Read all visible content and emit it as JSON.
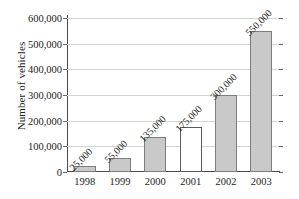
{
  "chart_data": {
    "type": "bar",
    "title": "",
    "xlabel": "",
    "ylabel": "Number of vehicles",
    "categories": [
      "1998",
      "1999",
      "2000",
      "2001",
      "2002",
      "2003"
    ],
    "values": [
      25000,
      55000,
      135000,
      175000,
      300000,
      550000
    ],
    "data_labels": [
      "25,000",
      "55,000",
      "135,000",
      "175,000",
      "300,000",
      "550,000"
    ],
    "data_label_rotation_deg": -45,
    "bar_styles": [
      "filled",
      "filled",
      "filled",
      "hollow",
      "filled",
      "filled"
    ],
    "ylim": [
      0,
      600000
    ],
    "ytick_values": [
      0,
      100000,
      200000,
      300000,
      400000,
      500000,
      600000
    ],
    "ytick_labels": [
      "0",
      "100,000",
      "200,000",
      "300,000",
      "400,000",
      "500,000",
      "600,000"
    ],
    "grid": true,
    "legend": null,
    "colors": {
      "bar_fill": "#c9c9c9",
      "bar_edge": "#7d7d7d",
      "hollow_fill": "#ffffff",
      "hollow_edge": "#5a5a5a",
      "gridline": "#d3d3d3",
      "axis": "#4a4a4a",
      "text": "#1d1d1d",
      "background": "#ffffff"
    }
  }
}
